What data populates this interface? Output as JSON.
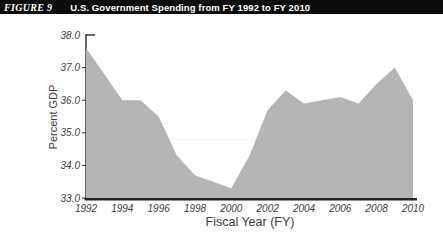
{
  "header": {
    "figure_label": "FIGURE 9",
    "title": "U.S. Government Spending from FY 1992 to FY 2010"
  },
  "colors": {
    "header_bg": "#0c0c0c",
    "header_text": "#ffffff",
    "area": "#b5b5b5",
    "axis": "#262626",
    "text": "#3d3d3d",
    "reference_line": "#f7f7f7"
  },
  "chart_data": {
    "type": "area",
    "title": "U.S. Government Spending from FY 1992 to FY 2010",
    "xlabel": "Fiscal Year (FY)",
    "ylabel": "Percent GDP",
    "x": [
      1992,
      1993,
      1994,
      1995,
      1996,
      1997,
      1998,
      1999,
      2000,
      2001,
      2002,
      2003,
      2004,
      2005,
      2006,
      2007,
      2008,
      2009,
      2010
    ],
    "values": [
      37.6,
      36.8,
      36.0,
      36.0,
      35.5,
      34.3,
      33.7,
      33.5,
      33.3,
      34.3,
      35.7,
      36.3,
      35.9,
      36.0,
      36.1,
      35.9,
      36.5,
      37.0,
      36.0
    ],
    "ylim": [
      33.0,
      38.0
    ],
    "ytick_labels": [
      "38.0",
      "37.0",
      "36.0",
      "35.0",
      "34.0",
      "33.0"
    ],
    "xtick_labels": [
      "1992",
      "1994",
      "1996",
      "1998",
      "2000",
      "2002",
      "2004",
      "2006",
      "2008",
      "2010"
    ],
    "reference_line": 34.8,
    "grid": false,
    "legend": "none"
  }
}
